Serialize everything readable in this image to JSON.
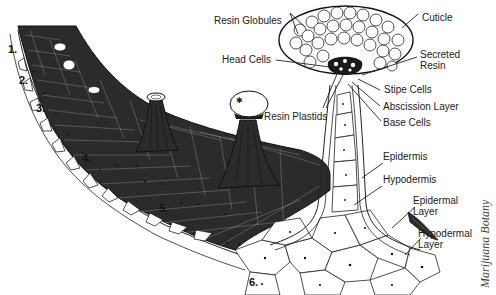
{
  "figure": {
    "credit": "Marijuana Botany",
    "layer_numbers": [
      "1.",
      "2.",
      "3.",
      "4.",
      "5.",
      "6."
    ],
    "labels": {
      "resin_globules": "Resin Globules",
      "cuticle": "Cuticle",
      "head_cells": "Head Cells",
      "secreted_resin_line1": "Secreted",
      "secreted_resin_line2": "Resin",
      "stipe_cells": "Stipe Cells",
      "resin_plastids": "Resin Plastids",
      "abscission_layer": "Abscission Layer",
      "base_cells": "Base Cells",
      "epidermis": "Epidermis",
      "hypodermis": "Hypodermis",
      "epidermal_layer_line1": "Epidermal",
      "epidermal_layer_line2": "Layer",
      "hypodermal_layer_line1": "Hypodermal",
      "hypodermal_layer_line2": "Layer"
    },
    "colors": {
      "ink": "#1a1a1a",
      "background": "#ffffff",
      "tissue_fill": "#2b2b2b"
    }
  }
}
